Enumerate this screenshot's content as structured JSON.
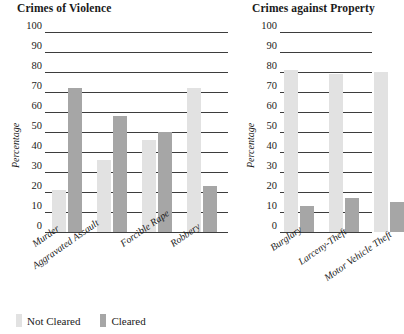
{
  "legend": {
    "entries": [
      {
        "label": "Not Cleared",
        "color": "#e2e2e2",
        "key": "not_cleared"
      },
      {
        "label": "Cleared",
        "color": "#a6a6a6",
        "key": "cleared"
      }
    ]
  },
  "charts": [
    {
      "id": "violence",
      "title": "Crimes of Violence",
      "ylabel": "Percentage"
    },
    {
      "id": "property",
      "title": "Crimes against Property",
      "ylabel": "Percentage"
    }
  ],
  "chart_data": [
    {
      "type": "bar",
      "title": "Crimes of Violence",
      "xlabel": "",
      "ylabel": "Percentage",
      "ylim": [
        0,
        100
      ],
      "yticks": [
        0,
        10,
        20,
        30,
        40,
        50,
        60,
        70,
        80,
        90,
        100
      ],
      "grid": true,
      "legend": "bottom",
      "categories": [
        "Murder",
        "Aggravated Assault",
        "Forcible Rape",
        "Robbery"
      ],
      "series": [
        {
          "name": "Not Cleared",
          "color": "#e2e2e2",
          "values": [
            21,
            36,
            46,
            72
          ]
        },
        {
          "name": "Cleared",
          "color": "#a6a6a6",
          "values": [
            72,
            58,
            50,
            23
          ]
        }
      ]
    },
    {
      "type": "bar",
      "title": "Crimes against Property",
      "xlabel": "",
      "ylabel": "Percentage",
      "ylim": [
        0,
        100
      ],
      "yticks": [
        0,
        10,
        20,
        30,
        40,
        50,
        60,
        70,
        80,
        90,
        100
      ],
      "grid": true,
      "legend": "bottom",
      "categories": [
        "Burglary",
        "Larceny-Theft",
        "Motor Vehicle Theft"
      ],
      "series": [
        {
          "name": "Not Cleared",
          "color": "#e2e2e2",
          "values": [
            81,
            79,
            80
          ]
        },
        {
          "name": "Cleared",
          "color": "#a6a6a6",
          "values": [
            13,
            17,
            15
          ]
        }
      ]
    }
  ]
}
